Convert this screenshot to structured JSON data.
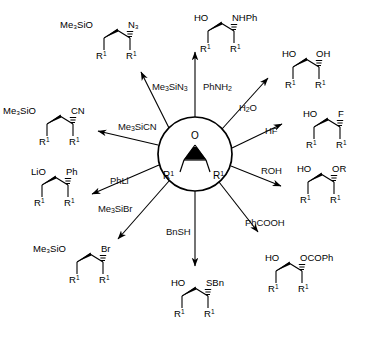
{
  "figure": {
    "type": "radial-reaction-scheme",
    "background": "#ffffff",
    "line_color": "#000000",
    "center": {
      "name": "epoxide",
      "heteroatom": "O",
      "left_substituent": "R",
      "left_superscript": "1",
      "right_substituent": "R",
      "right_superscript": "1"
    }
  },
  "reactions": [
    {
      "id": "azide",
      "reagent": "Me₃SiN₃",
      "reagent_parts": {
        "pre": "Me",
        "sub1": "3",
        "mid": "SiN",
        "sub2": "3",
        "post": ""
      },
      "product_left": "Me₃SiO",
      "product_right": "N₃",
      "lower_left": "R",
      "lower_right": "R",
      "direction": "upper-left"
    },
    {
      "id": "amino-alcohol",
      "reagent": "PhNH₂",
      "reagent_parts": {
        "pre": "PhNH",
        "sub1": "2",
        "mid": "",
        "sub2": "",
        "post": ""
      },
      "product_left": "HO",
      "product_right": "NHPh",
      "lower_left": "R",
      "lower_right": "R",
      "direction": "up"
    },
    {
      "id": "diol",
      "reagent": "H₂O",
      "reagent_parts": {
        "pre": "H",
        "sub1": "2",
        "mid": "O",
        "sub2": "",
        "post": ""
      },
      "product_left": "HO",
      "product_right": "OH",
      "lower_left": "R",
      "lower_right": "R",
      "direction": "upper-right"
    },
    {
      "id": "fluorohydrin",
      "reagent": "HF",
      "reagent_parts": {
        "pre": "HF",
        "sub1": "",
        "mid": "",
        "sub2": "",
        "post": ""
      },
      "product_left": "HO",
      "product_right": "F",
      "lower_left": "R",
      "lower_right": "R",
      "direction": "right"
    },
    {
      "id": "ether",
      "reagent": "ROH",
      "reagent_parts": {
        "pre": "ROH",
        "sub1": "",
        "mid": "",
        "sub2": "",
        "post": ""
      },
      "product_left": "HO",
      "product_right": "OR",
      "lower_left": "R",
      "lower_right": "R",
      "direction": "lower-right"
    },
    {
      "id": "benzoate",
      "reagent": "PhCOOH",
      "reagent_parts": {
        "pre": "PhCOOH",
        "sub1": "",
        "mid": "",
        "sub2": "",
        "post": ""
      },
      "product_left": "HO",
      "product_right": "OCOPh",
      "lower_left": "R",
      "lower_right": "R",
      "direction": "lower-right-down"
    },
    {
      "id": "thioether",
      "reagent": "BnSH",
      "reagent_parts": {
        "pre": "BnSH",
        "sub1": "",
        "mid": "",
        "sub2": "",
        "post": ""
      },
      "product_left": "HO",
      "product_right": "SBn",
      "lower_left": "R",
      "lower_right": "R",
      "direction": "down"
    },
    {
      "id": "bromide",
      "reagent": "Me₃SiBr",
      "reagent_parts": {
        "pre": "Me",
        "sub1": "3",
        "mid": "SiBr",
        "sub2": "",
        "post": ""
      },
      "product_left": "Me₃SiO",
      "product_right": "Br",
      "lower_left": "R",
      "lower_right": "R",
      "direction": "lower-left"
    },
    {
      "id": "phenyl-carbinol",
      "reagent": "PhLi",
      "reagent_parts": {
        "pre": "PhLi",
        "sub1": "",
        "mid": "",
        "sub2": "",
        "post": ""
      },
      "product_left": "LiO",
      "product_right": "Ph",
      "lower_left": "R",
      "lower_right": "R",
      "direction": "left"
    },
    {
      "id": "nitrile",
      "reagent": "Me₃SiCN",
      "reagent_parts": {
        "pre": "Me",
        "sub1": "3",
        "mid": "SiCN",
        "sub2": "",
        "post": ""
      },
      "product_left": "Me₃SiO",
      "product_right": "CN",
      "lower_left": "R",
      "lower_right": "R",
      "direction": "upper-left-high"
    }
  ],
  "superscript": "1"
}
